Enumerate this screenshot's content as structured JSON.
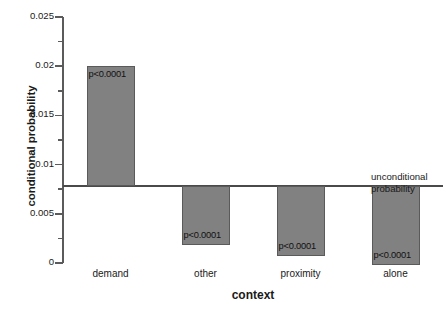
{
  "chart_data": {
    "type": "bar",
    "title": "",
    "xlabel": "context",
    "ylabel": "conditional probability",
    "categories": [
      "demand",
      "other",
      "proximity",
      "alone"
    ],
    "values": [
      0.02,
      0.0018,
      0.0007,
      -0.0002
    ],
    "baseline": 0.0078,
    "baseline_label_line1": "unconditional",
    "baseline_label_line2": "probability",
    "point_labels": [
      "p<0.0001",
      "p<0.0001",
      "p<0.0001",
      "p<0.0001"
    ],
    "ylim": [
      0,
      0.025
    ],
    "yticks": [
      0,
      0.005,
      0.01,
      0.015,
      0.02,
      0.025
    ],
    "ytick_labels": [
      "0",
      "0.005",
      "0.01",
      "0.015",
      "0.02",
      "0.025"
    ],
    "yticks_minor": [
      0.0025,
      0.0075,
      0.0125,
      0.0175,
      0.0225
    ],
    "grid": false,
    "legend": "none",
    "bar_color": "#818181",
    "bar_edge_color": "#5a5a5a",
    "axis_color": "#5b5b5b"
  }
}
